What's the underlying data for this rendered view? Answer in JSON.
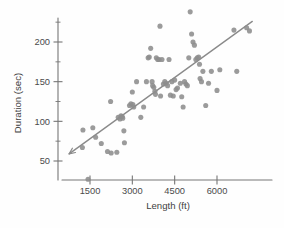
{
  "chart_data": {
    "type": "scatter",
    "title": "",
    "xlabel": "Length (ft)",
    "ylabel": "Duration (sec)",
    "xlim": [
      700,
      7300
    ],
    "ylim": [
      10,
      245
    ],
    "xticks": [
      1500,
      3000,
      4500,
      6000
    ],
    "yticks": [
      50,
      100,
      150,
      200
    ],
    "xticklabels": [
      "1500",
      "3000",
      "4500",
      "6000"
    ],
    "yticklabels": [
      "50",
      "100",
      "150",
      "200"
    ],
    "grid": false,
    "legend": null,
    "marker_color": "#8d8d8d",
    "line_color": "#8a8a8a",
    "axis_color": "#767676",
    "series": [
      {
        "name": "observations",
        "x": [
          1230,
          1430,
          1250,
          1600,
          1700,
          1900,
          2120,
          2230,
          2250,
          2450,
          2500,
          2560,
          2600,
          2640,
          2660,
          2700,
          2720,
          2900,
          2950,
          3000,
          3020,
          3050,
          3150,
          3300,
          3400,
          3500,
          3560,
          3600,
          3650,
          3700,
          3720,
          3760,
          3800,
          3820,
          3850,
          3900,
          3950,
          3980,
          4000,
          4050,
          4100,
          4150,
          4200,
          4250,
          4300,
          4350,
          4400,
          4450,
          4500,
          4550,
          4600,
          4700,
          4750,
          4800,
          4850,
          4900,
          4950,
          5000,
          5050,
          5100,
          5150,
          5200,
          5250,
          5300,
          5350,
          5380,
          5400,
          5450,
          5500,
          5600,
          5700,
          5800,
          6000,
          6100,
          6600,
          6700,
          7050,
          7150
        ],
        "y": [
          67,
          27,
          89,
          92,
          80,
          72,
          62,
          125,
          60,
          61,
          105,
          103,
          107,
          106,
          104,
          88,
          73,
          120,
          122,
          137,
          121,
          118,
          150,
          105,
          118,
          150,
          180,
          181,
          192,
          150,
          145,
          143,
          138,
          134,
          180,
          178,
          178,
          220,
          132,
          178,
          147,
          150,
          148,
          145,
          178,
          133,
          150,
          132,
          152,
          140,
          142,
          148,
          131,
          118,
          150,
          147,
          145,
          180,
          238,
          210,
          200,
          196,
          178,
          180,
          181,
          172,
          154,
          150,
          163,
          120,
          148,
          163,
          139,
          165,
          215,
          163,
          218,
          214
        ]
      }
    ],
    "trendline": {
      "name": "least-squares fit",
      "x_start": 760,
      "y_start": 59,
      "x_end": 7250,
      "y_end": 226,
      "has_left_arrow": true
    }
  }
}
